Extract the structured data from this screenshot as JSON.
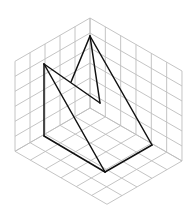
{
  "diagram": {
    "type": "isometric-grid-solid",
    "canvas": {
      "width": 189,
      "height": 217,
      "background": "#ffffff"
    },
    "colors": {
      "grid": "#bdbdbd",
      "shape": "#111111"
    },
    "grid": {
      "origin_top": [
        90,
        18
      ],
      "unit_left": [
        -15,
        8.66
      ],
      "unit_right": [
        15.33,
        8.83
      ],
      "unit_up": [
        0,
        -15
      ],
      "depth_cells": 5,
      "width_cells": 6,
      "height_cells": 6,
      "faces": [
        "left-wall",
        "right-wall",
        "floor"
      ]
    },
    "shape": {
      "vertices": {
        "apex": [
          90,
          36
        ],
        "left_top": [
          44,
          64
        ],
        "notch": [
          100,
          103
        ],
        "left_bottom": [
          44,
          136
        ],
        "bottom": [
          105,
          172
        ],
        "right": [
          152,
          145
        ],
        "hidden_meet": [
          71,
          82
        ]
      },
      "edges": [
        [
          "left_top",
          "left_bottom"
        ],
        [
          "left_bottom",
          "bottom"
        ],
        [
          "bottom",
          "right"
        ],
        [
          "right",
          "apex"
        ],
        [
          "apex",
          "notch"
        ],
        [
          "notch",
          "left_top"
        ],
        [
          "left_top",
          "bottom"
        ],
        [
          "apex",
          "hidden_meet"
        ]
      ]
    }
  }
}
